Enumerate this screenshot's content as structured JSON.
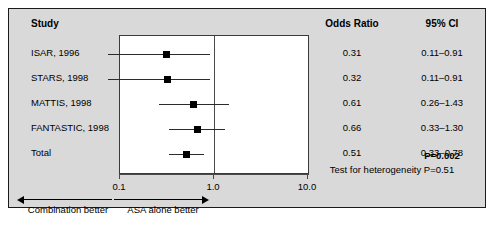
{
  "figure": {
    "headers": {
      "study": "Study",
      "odds_ratio": "Odds Ratio",
      "ci": "95% CI"
    },
    "footer": {
      "p_value": "P=0.002",
      "heterogeneity": "Test for heterogeneity P=0.51"
    },
    "axis": {
      "ticks": [
        "0.1",
        "1.0",
        "10.0"
      ]
    },
    "annotations": {
      "left": "Combination better",
      "right": "ASA alone better"
    },
    "colors": {
      "panel_bg": "#d9d9d9",
      "plot_bg": "#ffffff",
      "border": "#1a1a1a",
      "marker": "#000000",
      "refline": "#4a4a4a"
    }
  },
  "chart_data": {
    "type": "forest",
    "title": "",
    "xlabel": "Odds Ratio",
    "ylabel": "",
    "xscale": "log",
    "xlim": [
      0.1,
      10.0
    ],
    "xticks": [
      0.1,
      1.0,
      10.0
    ],
    "reference_line": 1.0,
    "grid": false,
    "legend": "none",
    "columns": [
      "Study",
      "Odds Ratio",
      "95% CI"
    ],
    "rows": [
      {
        "study": "ISAR, 1996",
        "or": 0.31,
        "or_text": "0.31",
        "ci_text": "0.11–0.91",
        "low": 0.11,
        "high": 0.91,
        "is_total": false,
        "clipped_low": true
      },
      {
        "study": "STARS, 1998",
        "or": 0.32,
        "or_text": "0.32",
        "ci_text": "0.11–0.91",
        "low": 0.11,
        "high": 0.91,
        "is_total": false,
        "clipped_low": true
      },
      {
        "study": "MATTIS, 1998",
        "or": 0.61,
        "or_text": "0.61",
        "ci_text": "0.26–1.43",
        "low": 0.26,
        "high": 1.43,
        "is_total": false,
        "clipped_low": false
      },
      {
        "study": "FANTASTIC, 1998",
        "or": 0.66,
        "or_text": "0.66",
        "ci_text": "0.33–1.30",
        "low": 0.33,
        "high": 1.3,
        "is_total": false,
        "clipped_low": false
      },
      {
        "study": "Total",
        "or": 0.51,
        "or_text": "0.51",
        "ci_text": "0.33–0.78",
        "low": 0.33,
        "high": 0.78,
        "is_total": true,
        "clipped_low": false
      }
    ],
    "annotations": {
      "p_value": "P=0.002",
      "heterogeneity": "Test for heterogeneity P=0.51",
      "left_arrow_label": "Combination better",
      "right_arrow_label": "ASA alone better"
    }
  }
}
